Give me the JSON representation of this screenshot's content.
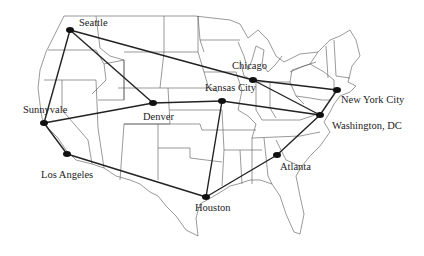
{
  "diagram": {
    "type": "network-map",
    "background": "map of the contiguous United States with state boundaries",
    "nodes": [
      {
        "id": "seattle",
        "label": "Seattle",
        "x": 70,
        "y": 30,
        "lx": 79,
        "ly": 26
      },
      {
        "id": "sunnyvale",
        "label": "Sunnyvale",
        "x": 44,
        "y": 123,
        "lx": 23,
        "ly": 113
      },
      {
        "id": "los-angeles",
        "label": "Los Angeles",
        "x": 67,
        "y": 154,
        "lx": 41,
        "ly": 178
      },
      {
        "id": "denver",
        "label": "Denver",
        "x": 153,
        "y": 103,
        "lx": 143,
        "ly": 120
      },
      {
        "id": "kansas-city",
        "label": "Kansas City",
        "x": 222,
        "y": 101,
        "lx": 205,
        "ly": 91
      },
      {
        "id": "chicago",
        "label": "Chicago",
        "x": 253,
        "y": 80,
        "lx": 232,
        "ly": 69
      },
      {
        "id": "new-york-city",
        "label": "New York City",
        "x": 337,
        "y": 90,
        "lx": 341,
        "ly": 103
      },
      {
        "id": "washington-dc",
        "label": "Washington, DC",
        "x": 320,
        "y": 115,
        "lx": 332,
        "ly": 129
      },
      {
        "id": "atlanta",
        "label": "Atlanta",
        "x": 277,
        "y": 155,
        "lx": 280,
        "ly": 170
      },
      {
        "id": "houston",
        "label": "Houston",
        "x": 206,
        "y": 197,
        "lx": 195,
        "ly": 211
      }
    ],
    "edges": [
      [
        "seattle",
        "sunnyvale"
      ],
      [
        "seattle",
        "denver"
      ],
      [
        "seattle",
        "chicago"
      ],
      [
        "sunnyvale",
        "denver"
      ],
      [
        "sunnyvale",
        "los-angeles"
      ],
      [
        "los-angeles",
        "houston"
      ],
      [
        "denver",
        "kansas-city"
      ],
      [
        "kansas-city",
        "houston"
      ],
      [
        "kansas-city",
        "washington-dc"
      ],
      [
        "chicago",
        "new-york-city"
      ],
      [
        "chicago",
        "washington-dc"
      ],
      [
        "new-york-city",
        "washington-dc"
      ],
      [
        "washington-dc",
        "atlanta"
      ],
      [
        "atlanta",
        "houston"
      ]
    ]
  }
}
